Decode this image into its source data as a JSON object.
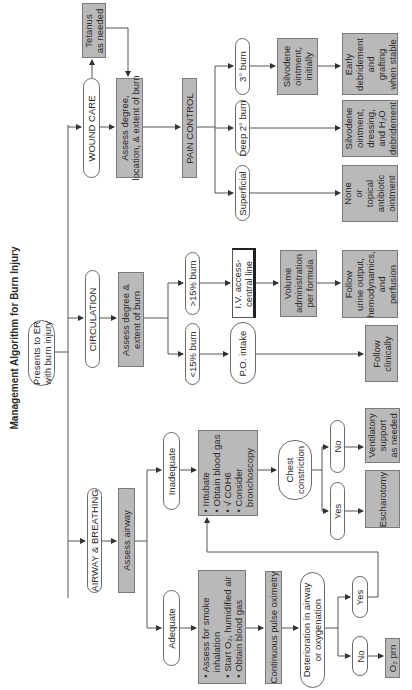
{
  "start": "Presents to ER\nwith burn injury",
  "wound_care": {
    "label": "WOUND CARE",
    "tetanus": "Tetanus\nas needed",
    "assess": "Assess degree,\nlocation, & extent of burn",
    "pain_control": "PAIN CONTROL",
    "branches": [
      {
        "label": "3° burn",
        "step1": "Silvodene\nointment,\ninitially",
        "step2": "Early\ndebridement\nand\ngrafting\nwhen stable"
      },
      {
        "label": "Deep 2° burn",
        "step2": "Silvodene\nointment,\ndressing,\nand H₂O\ndebridement"
      },
      {
        "label": "Superficial",
        "step2": "None\nor\ntopical\nantibiotic\nointment"
      }
    ]
  },
  "circulation": {
    "label": "CIRCULATION",
    "assess": "Assess degree &\nextent of burn",
    "gt15": {
      "label": ">15% burn",
      "step1": "I.V. access-\ncentral line",
      "step2": "Volume\nadministration\nper formula",
      "step3": "Follow\nurine output,\nhemodynamics,\nand\nperfusion"
    },
    "lt15": {
      "label": "<15% burn",
      "step1": "P.O. intake",
      "step2": "Follow\nclinically"
    }
  },
  "airway": {
    "label": "AIRWAY & BREATHING",
    "assess": "Assess airway",
    "inadequate": {
      "label": "Inadequate",
      "actions": [
        "Intubate",
        "Obtain blood gas",
        "√ COH6",
        "Consider",
        "bronchoscopy"
      ],
      "chest": "Chest\nconstriction",
      "no": "No",
      "no_result": "Ventilatory\nsupport\nas needed",
      "yes": "Yes",
      "yes_result": "Escharotomy"
    },
    "adequate": {
      "label": "Adequate",
      "actions": [
        "Assess for smoke",
        "inhalation",
        "Start O₂, humidified air",
        "Obtain blood gas"
      ],
      "monitor": "Continuous pulse oximetry",
      "deterioration": "Deterioration in airway\nor oxygenation",
      "yes": "Yes",
      "no": "No",
      "no_result": "O₂ prn"
    }
  },
  "colors": {
    "box_fill": "#b9b9b9",
    "border": "#6a6a6a",
    "line": "#444444",
    "background": "#ffffff"
  }
}
